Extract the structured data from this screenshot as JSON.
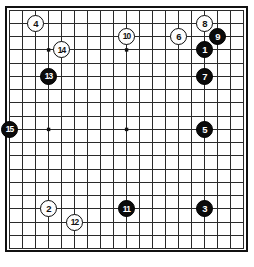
{
  "diagram": {
    "type": "go-board-diagram",
    "board_size": 19,
    "colors": {
      "board_background": "#ffffff",
      "grid_line": "#2a2a2a",
      "border": "#111111",
      "black_stone": "#0b0b0b",
      "white_stone": "#fdfdfd",
      "black_label_text": "#ffffff",
      "white_label_text": "#111111"
    },
    "star_points": [
      {
        "col": 4,
        "row": 4
      },
      {
        "col": 10,
        "row": 4
      },
      {
        "col": 16,
        "row": 4
      },
      {
        "col": 4,
        "row": 10
      },
      {
        "col": 10,
        "row": 10
      },
      {
        "col": 16,
        "row": 10
      },
      {
        "col": 4,
        "row": 16
      },
      {
        "col": 10,
        "row": 16
      },
      {
        "col": 16,
        "row": 16
      }
    ],
    "moves": [
      {
        "label": "1",
        "color": "black",
        "col": 16,
        "row": 4
      },
      {
        "label": "2",
        "color": "white",
        "col": 4,
        "row": 16
      },
      {
        "label": "3",
        "color": "black",
        "col": 16,
        "row": 16
      },
      {
        "label": "4",
        "color": "white",
        "col": 3,
        "row": 2
      },
      {
        "label": "5",
        "color": "black",
        "col": 16,
        "row": 10
      },
      {
        "label": "6",
        "color": "white",
        "col": 14,
        "row": 3
      },
      {
        "label": "7",
        "color": "black",
        "col": 16,
        "row": 6
      },
      {
        "label": "8",
        "color": "white",
        "col": 16,
        "row": 2
      },
      {
        "label": "9",
        "color": "black",
        "col": 17,
        "row": 3
      },
      {
        "label": "10",
        "color": "white",
        "col": 10,
        "row": 3
      },
      {
        "label": "11",
        "color": "black",
        "col": 10,
        "row": 16
      },
      {
        "label": "12",
        "color": "white",
        "col": 6,
        "row": 17
      },
      {
        "label": "13",
        "color": "black",
        "col": 4,
        "row": 6
      },
      {
        "label": "14",
        "color": "white",
        "col": 5,
        "row": 4
      },
      {
        "label": "15",
        "color": "black",
        "col": 1,
        "row": 10
      }
    ]
  }
}
